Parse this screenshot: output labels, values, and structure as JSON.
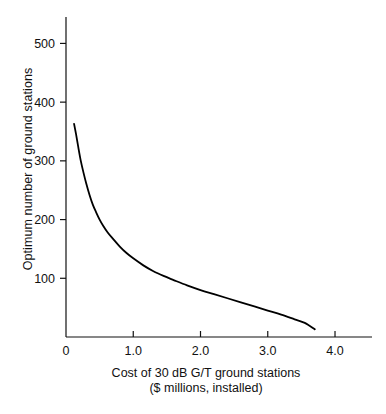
{
  "chart_data": {
    "type": "line",
    "title": "",
    "xlabel": "Cost of 30 dB G/T ground stations",
    "xlabel_line2": "($ millions, installed)",
    "ylabel": "Optimum number of ground stations",
    "xlim": [
      0,
      4.55
    ],
    "ylim": [
      0,
      545
    ],
    "xticks": [
      0,
      1.0,
      2.0,
      3.0,
      4.0
    ],
    "xtick_labels": [
      "0",
      "1.0",
      "2.0",
      "3.0",
      "4.0"
    ],
    "yticks": [
      100,
      200,
      300,
      400,
      500
    ],
    "ytick_labels": [
      "100",
      "200",
      "300",
      "400",
      "500"
    ],
    "grid": false,
    "legend": null,
    "series": [
      {
        "name": "Optimum number of ground stations vs cost",
        "color": "#000000",
        "x": [
          0.12,
          0.15,
          0.18,
          0.22,
          0.26,
          0.3,
          0.35,
          0.4,
          0.45,
          0.5,
          0.55,
          0.62,
          0.7,
          0.8,
          0.9,
          1.0,
          1.15,
          1.3,
          1.45,
          1.6,
          1.8,
          2.0,
          2.2,
          2.4,
          2.6,
          2.8,
          3.0,
          3.2,
          3.4,
          3.55,
          3.7
        ],
        "y": [
          363,
          345,
          325,
          300,
          280,
          262,
          242,
          225,
          212,
          200,
          190,
          178,
          167,
          154,
          143,
          134,
          122,
          112,
          104,
          97,
          88,
          80,
          73,
          66,
          59,
          52,
          45,
          38,
          30,
          24,
          13
        ]
      }
    ]
  },
  "axes": {
    "tick_direction": "out",
    "axis_color": "#111111",
    "line_width": 1,
    "curve_width": 1.8
  }
}
